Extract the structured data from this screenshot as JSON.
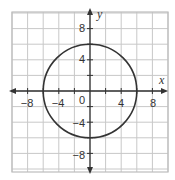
{
  "chart_data": {
    "type": "line",
    "title": "",
    "xlabel": "x",
    "ylabel": "y",
    "xlim": [
      -10,
      10
    ],
    "ylim": [
      -10,
      10
    ],
    "grid": true,
    "grid_step": 2,
    "x_ticks": [
      "−8",
      "−4",
      "0",
      "4",
      "8"
    ],
    "y_ticks": [
      "8",
      "4",
      "−4",
      "−8"
    ],
    "origin_label": "0",
    "series": [
      {
        "name": "circle",
        "shape": "circle",
        "center": [
          0,
          0
        ],
        "radius": 6,
        "equation": "x^2 + y^2 = 36",
        "color": "#333333"
      }
    ]
  },
  "labels": {
    "x_axis": "x",
    "y_axis": "y",
    "x_tick_neg8": "−8",
    "x_tick_neg4": "−4",
    "origin": "0",
    "x_tick_4": "4",
    "x_tick_8": "8",
    "y_tick_8": "8",
    "y_tick_4": "4",
    "y_tick_neg4": "−4",
    "y_tick_neg8": "−8"
  },
  "colors": {
    "grid": "#c8c8c8",
    "axis": "#333333",
    "curve": "#333333",
    "background": "#ffffff"
  }
}
